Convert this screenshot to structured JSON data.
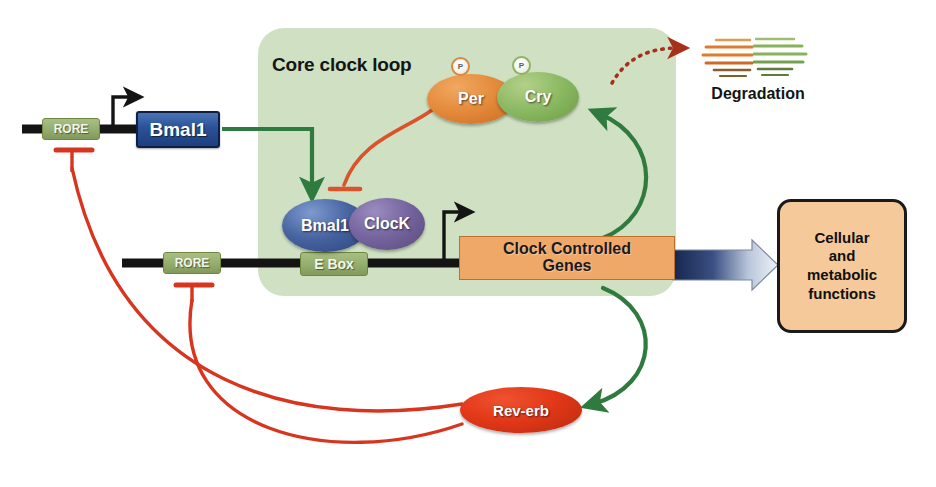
{
  "diagram": {
    "panel": {
      "label": "Core clock loop",
      "color": "#cfe0c3"
    }
  },
  "genes": {
    "bmal1_gene": "Bmal1",
    "rore_top": "RORE",
    "rore_bottom": "RORE",
    "e_box": "E Box"
  },
  "proteins": {
    "per": "Per",
    "cry": "Cry",
    "bmal1": "Bmal1",
    "clock": "ClocK",
    "rev_erb": "Rev-erb"
  },
  "modifications": {
    "phosphate_per": "P",
    "phosphate_cry": "P"
  },
  "output": {
    "ccg_line1": "Clock Controlled",
    "ccg_line2": "Genes",
    "cellular_line1": "Cellular",
    "cellular_line2": "and",
    "cellular_line3": "metabolic",
    "cellular_line4": "functions"
  },
  "degradation": {
    "label": "Degradation"
  },
  "colors": {
    "panel_green": "#cfe0c3",
    "activation_green": "#2f7a3e",
    "inhibition_red": "#e03c25",
    "percry_inhibition": "#d9532b",
    "degradation_arrow": "#a8301a",
    "bmal1_blue": "#2a5196",
    "clock_purple": "#75649e",
    "per_orange": "#e58b3c",
    "cry_green": "#8cb963",
    "reverb_red": "#e03718",
    "ccg_orange": "#f0a868",
    "cellular_peach": "#f6c99a",
    "dna_black": "#141414",
    "dna_element_green": "#93ad6d",
    "output_arrow_dark": "#1d2d5c",
    "output_arrow_light": "#e8eef6"
  },
  "edges": [
    {
      "name": "bmal1-transcription-arrow",
      "kind": "tss-arrow",
      "from": "Bmal1 promoter",
      "to": "Bmal1 gene"
    },
    {
      "name": "ebox-transcription-arrow",
      "kind": "tss-arrow",
      "from": "E Box promoter",
      "to": "Clock Controlled Genes"
    },
    {
      "name": "bmal1-to-ebox-activation",
      "kind": "activation",
      "from": "Bmal1",
      "to": "Bmal1/ClocK heterodimer"
    },
    {
      "name": "percry-inhibits-ebox",
      "kind": "inhibition",
      "from": "Per/Cry",
      "to": "Bmal1/ClocK complex"
    },
    {
      "name": "ccg-to-percry-activation",
      "kind": "activation",
      "from": "Clock Controlled Genes",
      "to": "Cry"
    },
    {
      "name": "ccg-to-reverb-activation",
      "kind": "activation",
      "from": "Clock Controlled Genes",
      "to": "Rev-erb"
    },
    {
      "name": "reverb-inhibits-rore-top",
      "kind": "inhibition",
      "from": "Rev-erb",
      "to": "RORE (Bmal1 promoter)"
    },
    {
      "name": "reverb-inhibits-rore-bottom",
      "kind": "inhibition",
      "from": "Rev-erb",
      "to": "RORE (E Box promoter)"
    },
    {
      "name": "percry-degradation",
      "kind": "degradation",
      "from": "Per/Cry",
      "to": "Degradation"
    },
    {
      "name": "ccg-to-cellular-output",
      "kind": "output",
      "from": "Clock Controlled Genes",
      "to": "Cellular and metabolic functions"
    }
  ]
}
